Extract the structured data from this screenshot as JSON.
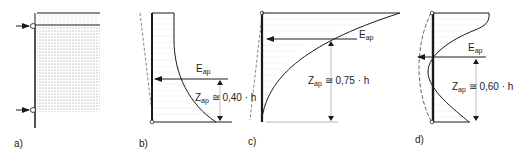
{
  "panels": [
    {
      "id": "a",
      "label": "a)"
    },
    {
      "id": "b",
      "label": "b)",
      "force": "E",
      "force_sub": "ap",
      "z": "Z",
      "z_sub": "ap",
      "approx": "≅",
      "value": "0,40 · h"
    },
    {
      "id": "c",
      "label": "c)",
      "force": "E",
      "force_sub": "ap",
      "z": "Z",
      "z_sub": "ap",
      "approx": "≅",
      "value": "0,75 · h"
    },
    {
      "id": "d",
      "label": "d)",
      "force": "E",
      "force_sub": "ap",
      "z": "Z",
      "z_sub": "ap",
      "approx": "≅",
      "value": "0,60 · h"
    }
  ],
  "colors": {
    "line": "#1a1a1a",
    "hatch": "#cccccc",
    "dashed": "#666666",
    "soil_dots": "#9a9a9a"
  }
}
